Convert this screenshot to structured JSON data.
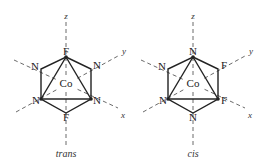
{
  "diagrams": [
    {
      "caption": "trans",
      "center_label": "Co",
      "axes": {
        "z": "z",
        "y": "y",
        "x": "x"
      },
      "ligands": {
        "top": "F",
        "upper_left": "N",
        "upper_right": "N",
        "lower_left": "N",
        "lower_right": "N",
        "bottom": "F"
      }
    },
    {
      "caption": "cis",
      "center_label": "Co",
      "axes": {
        "z": "z",
        "y": "y",
        "x": "x"
      },
      "ligands": {
        "top": "N",
        "upper_left": "N",
        "upper_right": "F",
        "lower_left": "N",
        "lower_right": "F",
        "bottom": "N"
      }
    }
  ]
}
